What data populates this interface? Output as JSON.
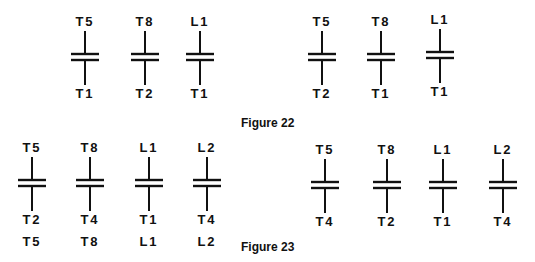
{
  "figures": [
    {
      "caption": "Figure 22",
      "groups": [
        {
          "contacts": [
            {
              "top": "T5",
              "bottom": "T1"
            },
            {
              "top": "T8",
              "bottom": "T2"
            },
            {
              "top": "L1",
              "bottom": "T1"
            }
          ]
        },
        {
          "contacts": [
            {
              "top": "T5",
              "bottom": "T2"
            },
            {
              "top": "T8",
              "bottom": "T1"
            },
            {
              "top": "L1",
              "bottom": "T1"
            }
          ]
        }
      ]
    },
    {
      "caption": "Figure 23",
      "groups": [
        {
          "contacts": [
            {
              "top": "T5",
              "bottom": "T2",
              "extra": "T5"
            },
            {
              "top": "T8",
              "bottom": "T4",
              "extra": "T8"
            },
            {
              "top": "L1",
              "bottom": "T1",
              "extra": "L1"
            },
            {
              "top": "L2",
              "bottom": "T4",
              "extra": "L2"
            }
          ]
        },
        {
          "contacts": [
            {
              "top": "T5",
              "bottom": "T4"
            },
            {
              "top": "T8",
              "bottom": "T2"
            },
            {
              "top": "L1",
              "bottom": "T1"
            },
            {
              "top": "L2",
              "bottom": "T4"
            }
          ]
        }
      ]
    }
  ]
}
